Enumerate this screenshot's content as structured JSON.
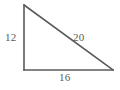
{
  "figure": {
    "type": "right-triangle-diagram",
    "background_color": "#ffffff",
    "stroke_color": "#5a5a5a",
    "label_color": "#5a5a5a",
    "vertices": {
      "top_left": [
        24,
        5
      ],
      "bottom_left": [
        24,
        70
      ],
      "bottom_right": [
        113,
        70
      ]
    },
    "labels": {
      "vertical_leg": "12",
      "hypotenuse": "20",
      "base": "16"
    }
  }
}
